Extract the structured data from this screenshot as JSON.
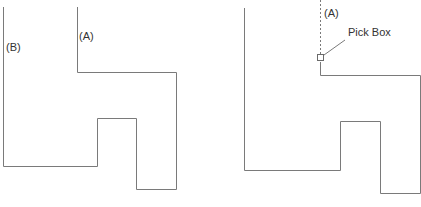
{
  "left_figure": {
    "label_a": "(A)",
    "label_b": "(B)"
  },
  "right_figure": {
    "label_a": "(A)",
    "pick_box_label": "Pick Box"
  },
  "colors": {
    "line": "#7a7a7a",
    "text": "#333333",
    "background": "#ffffff"
  }
}
